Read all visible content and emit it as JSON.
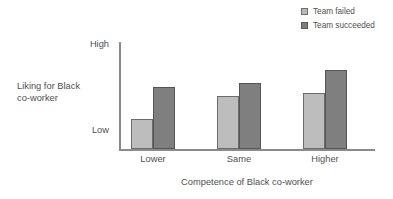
{
  "chart_data": {
    "type": "bar",
    "title": "",
    "xlabel": "Competence of Black co-worker",
    "ylabel": "Liking for Black co-worker",
    "ylabel_lines": [
      "Liking for Black",
      "co-worker"
    ],
    "categories": [
      "Lower",
      "Same",
      "Higher"
    ],
    "series": [
      {
        "name": "Team failed",
        "values": [
          28,
          50,
          52
        ],
        "color": "#bdbdbd",
        "border_color": "#6b6b6b"
      },
      {
        "name": "Team succeeded",
        "values": [
          58,
          62,
          74
        ],
        "color": "#7f7f7f",
        "border_color": "#555555"
      }
    ],
    "ylim": [
      0,
      100
    ],
    "ytick_labels": [
      "Low",
      "High"
    ],
    "ytick_values": [
      0,
      100
    ],
    "grid": false,
    "legend_position": "top-right",
    "axis_color": "#8a8a8a",
    "text_color": "#4f4f4f",
    "background": "#ffffff"
  },
  "legend": {
    "items": [
      {
        "label": "Team failed",
        "swatch": "legend-swatch-failed"
      },
      {
        "label": "Team succeeded",
        "swatch": "legend-swatch-succeeded"
      }
    ]
  },
  "axes": {
    "y_high_label": "High",
    "y_low_label": "Low",
    "y_title_line1": "Liking for Black",
    "y_title_line2": "co-worker",
    "x_title": "Competence of Black co-worker"
  }
}
